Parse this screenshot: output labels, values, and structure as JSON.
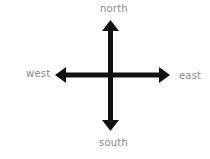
{
  "diagram": {
    "type": "compass-directions",
    "labels": {
      "north": "north",
      "south": "south",
      "east": "east",
      "west": "west"
    },
    "colors": {
      "arrow": "#111111",
      "label": "#8a8a8a",
      "background": "#ffffff"
    },
    "icons": {
      "vertical": "double-headed-vertical-arrow",
      "horizontal": "double-headed-horizontal-arrow"
    }
  }
}
